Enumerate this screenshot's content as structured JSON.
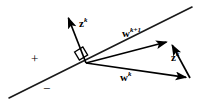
{
  "figure": {
    "name": "perceptron-weight-update-diagram",
    "background_color": "#ffffff",
    "stroke_color": "#000000",
    "labels": {
      "z_top": {
        "base": "z",
        "sup": "k"
      },
      "w_next": {
        "base": "w",
        "sup": "k+1"
      },
      "w_current": {
        "base": "w",
        "sup": "k"
      },
      "z_right": {
        "base": "z",
        "sup": "k"
      },
      "plus_sign": "+",
      "minus_sign": "−"
    },
    "geometry": {
      "decision_boundary": {
        "x1": 9,
        "y1": 98,
        "x2": 192,
        "y2": 7
      },
      "origin": {
        "x": 86,
        "y": 63
      },
      "z_top_arrow": {
        "x1": 86,
        "y1": 63,
        "x2": 66,
        "y2": 13
      },
      "w_next_arrow": {
        "x1": 86,
        "y1": 63,
        "x2": 170,
        "y2": 41
      },
      "w_current_arrow": {
        "x1": 86,
        "y1": 63,
        "x2": 190,
        "y2": 78
      },
      "z_right_arrow": {
        "x1": 190,
        "y1": 78,
        "x2": 170,
        "y2": 41
      },
      "right_angle_marker": {
        "cx": 79,
        "cy": 57,
        "size": 9
      }
    }
  }
}
